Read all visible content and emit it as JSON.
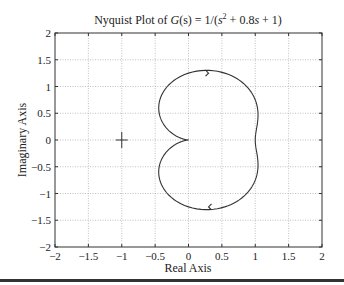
{
  "chart_data": {
    "type": "line",
    "title_parts": {
      "prefix": "Nyquist Plot of ",
      "G": "G",
      "s1": "(s) = 1/(",
      "s2": "s",
      "sup": "2",
      "rest": " + 0.8",
      "s3": "s",
      "tail": " + 1)"
    },
    "xlabel": "Real Axis",
    "ylabel": "Imaginary Axis",
    "xlim": [
      -2,
      2
    ],
    "ylim": [
      -2,
      2
    ],
    "xticks": [
      -2,
      -1.5,
      -1,
      -0.5,
      0,
      0.5,
      1,
      1.5,
      2
    ],
    "yticks": [
      -2,
      -1.5,
      -1,
      -0.5,
      0,
      0.5,
      1,
      1.5,
      2
    ],
    "xtick_labels": [
      "−2",
      "−1.5",
      "−1",
      "−0.5",
      "0",
      "0.5",
      "1",
      "1.5",
      "2"
    ],
    "ytick_labels": [
      "−2",
      "−1.5",
      "−1",
      "−0.5",
      "0",
      "0.5",
      "1",
      "1.5",
      "2"
    ],
    "grid": true,
    "transfer_function": {
      "num": [
        1
      ],
      "den": [
        1,
        0.8,
        1
      ]
    },
    "critical_point": {
      "x": -1,
      "y": 0,
      "marker": "+"
    },
    "series": [
      {
        "name": "positive frequency",
        "direction": "clockwise",
        "arrow_at": [
          0.3,
          -1.25
        ]
      },
      {
        "name": "negative frequency",
        "direction": "clockwise",
        "arrow_at": [
          0.3,
          1.25
        ]
      }
    ],
    "key_points": [
      {
        "omega": 0,
        "re": 1,
        "im": 0
      },
      {
        "omega": 1,
        "re": 0,
        "im": -1.25
      },
      {
        "omega": "inf",
        "re": 0,
        "im": 0
      }
    ]
  }
}
